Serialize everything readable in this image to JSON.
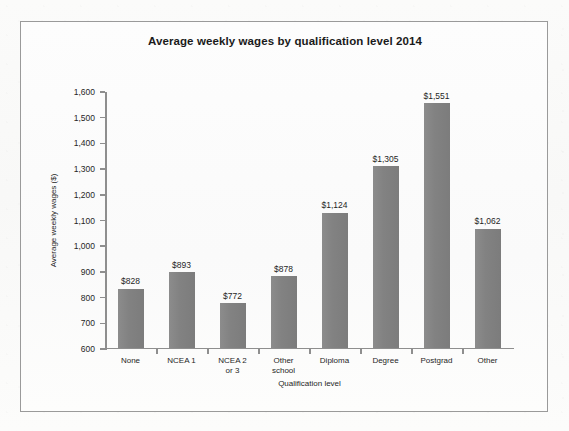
{
  "chart_data": {
    "type": "bar",
    "title": "Average weekly wages by qualification level 2014",
    "xlabel": "Qualification level",
    "ylabel": "Average weekly wages ($)",
    "categories": [
      "None",
      "NCEA 1",
      "NCEA 2\nor 3",
      "Other\nschool",
      "Diploma",
      "Degree",
      "Postgrad",
      "Other"
    ],
    "values": [
      828,
      893,
      772,
      878,
      1124,
      1305,
      1551,
      1062
    ],
    "value_labels": [
      "$828",
      "$893",
      "$772",
      "$878",
      "$1,124",
      "$1,305",
      "$1,551",
      "$1,062"
    ],
    "ylim": [
      600,
      1600
    ],
    "ytick_values": [
      600,
      700,
      800,
      900,
      1000,
      1100,
      1200,
      1300,
      1400,
      1500,
      1600
    ],
    "ytick_labels": [
      "600",
      "700",
      "800",
      "900",
      "1,000",
      "1,100",
      "1,200",
      "1,300",
      "1,400",
      "1,500",
      "1,600"
    ],
    "grid": false,
    "legend": false,
    "bar_color": "#828282",
    "axis_color": "#8e8e8e",
    "frame_color": "#9a9a9a",
    "background_color": "#fafafa"
  }
}
